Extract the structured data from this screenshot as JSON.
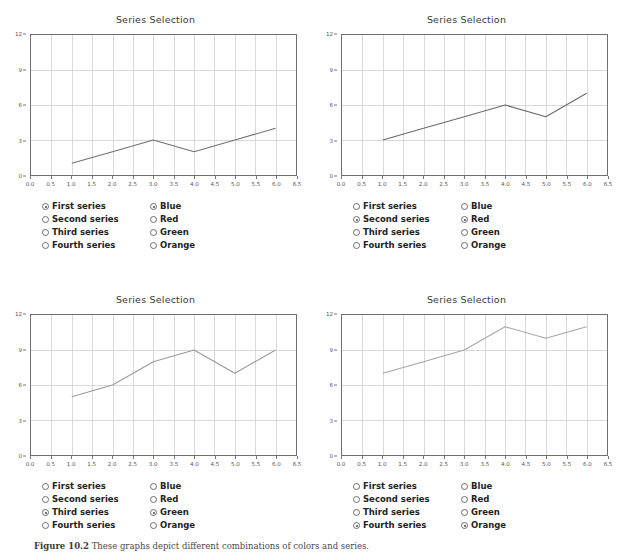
{
  "figure": {
    "caption_label": "Figure 10.2",
    "caption_text": "These graphs depict different combinations of colors and series."
  },
  "panels": [
    {
      "title": "Series Selection",
      "selected_series": "First series",
      "selected_color": "Blue",
      "series_options": [
        "First series",
        "Second series",
        "Third series",
        "Fourth series"
      ],
      "color_options": [
        "Blue",
        "Red",
        "Green",
        "Orange"
      ],
      "line_color": "#707070"
    },
    {
      "title": "Series Selection",
      "selected_series": "Second series",
      "selected_color": "Red",
      "series_options": [
        "First series",
        "Second series",
        "Third series",
        "Fourth series"
      ],
      "color_options": [
        "Blue",
        "Red",
        "Green",
        "Orange"
      ],
      "line_color": "#6a6a6a"
    },
    {
      "title": "Series Selection",
      "selected_series": "Third series",
      "selected_color": "Green",
      "series_options": [
        "First series",
        "Second series",
        "Third series",
        "Fourth series"
      ],
      "color_options": [
        "Blue",
        "Red",
        "Green",
        "Orange"
      ],
      "line_color": "#9a9a9a"
    },
    {
      "title": "Series Selection",
      "selected_series": "Fourth series",
      "selected_color": "Orange",
      "series_options": [
        "First series",
        "Second series",
        "Third series",
        "Fourth series"
      ],
      "color_options": [
        "Blue",
        "Red",
        "Green",
        "Orange"
      ],
      "line_color": "#a6a6a6"
    }
  ],
  "chart_data": [
    {
      "type": "line",
      "title": "Series Selection",
      "xlabel": "",
      "ylabel": "",
      "x": [
        1,
        2,
        3,
        4,
        5,
        6
      ],
      "series": [
        {
          "name": "First series",
          "values": [
            1,
            2,
            3,
            2,
            3,
            4
          ]
        }
      ],
      "xlim": [
        0.0,
        6.5
      ],
      "ylim": [
        0,
        12
      ],
      "xticks": [
        0.0,
        0.5,
        1.0,
        1.5,
        2.0,
        2.5,
        3.0,
        3.5,
        4.0,
        4.5,
        5.0,
        5.5,
        6.0,
        6.5
      ],
      "yticks": [
        0,
        3,
        6,
        9,
        12
      ],
      "grid": true,
      "legend": "none"
    },
    {
      "type": "line",
      "title": "Series Selection",
      "xlabel": "",
      "ylabel": "",
      "x": [
        1,
        2,
        3,
        4,
        5,
        6
      ],
      "series": [
        {
          "name": "Second series",
          "values": [
            3,
            4,
            5,
            6,
            5,
            7
          ]
        }
      ],
      "xlim": [
        0.0,
        6.5
      ],
      "ylim": [
        0,
        12
      ],
      "xticks": [
        0.0,
        0.5,
        1.0,
        1.5,
        2.0,
        2.5,
        3.0,
        3.5,
        4.0,
        4.5,
        5.0,
        5.5,
        6.0,
        6.5
      ],
      "yticks": [
        0,
        3,
        6,
        9,
        12
      ],
      "grid": true,
      "legend": "none"
    },
    {
      "type": "line",
      "title": "Series Selection",
      "xlabel": "",
      "ylabel": "",
      "x": [
        1,
        2,
        3,
        4,
        5,
        6
      ],
      "series": [
        {
          "name": "Third series",
          "values": [
            5,
            6,
            8,
            9,
            7,
            9
          ]
        }
      ],
      "xlim": [
        0.0,
        6.5
      ],
      "ylim": [
        0,
        12
      ],
      "xticks": [
        0.0,
        0.5,
        1.0,
        1.5,
        2.0,
        2.5,
        3.0,
        3.5,
        4.0,
        4.5,
        5.0,
        5.5,
        6.0,
        6.5
      ],
      "yticks": [
        0,
        3,
        6,
        9,
        12
      ],
      "grid": true,
      "legend": "none"
    },
    {
      "type": "line",
      "title": "Series Selection",
      "xlabel": "",
      "ylabel": "",
      "x": [
        1,
        2,
        3,
        4,
        5,
        6
      ],
      "series": [
        {
          "name": "Fourth series",
          "values": [
            7,
            8,
            9,
            11,
            10,
            11
          ]
        }
      ],
      "xlim": [
        0.0,
        6.5
      ],
      "ylim": [
        0,
        12
      ],
      "xticks": [
        0.0,
        0.5,
        1.0,
        1.5,
        2.0,
        2.5,
        3.0,
        3.5,
        4.0,
        4.5,
        5.0,
        5.5,
        6.0,
        6.5
      ],
      "yticks": [
        0,
        3,
        6,
        9,
        12
      ],
      "grid": true,
      "legend": "none"
    }
  ]
}
